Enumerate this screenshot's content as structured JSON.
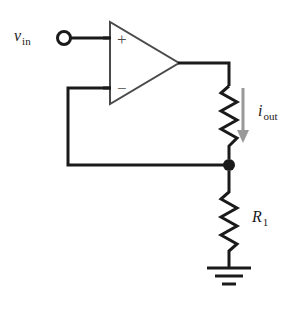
{
  "diagram": {
    "background_color": "#ffffff",
    "wire_color": "#1a1a1a",
    "component_color": "#1a1a1a",
    "arrow_color": "#999999",
    "opamp_outline_color": "#4a4a4a",
    "labels": {
      "input_voltage": {
        "base": "v",
        "subscript": "in"
      },
      "output_current": {
        "base": "i",
        "subscript": "out"
      },
      "resistor_feedback": {
        "base": "R",
        "subscript": "1"
      },
      "opamp_plus": "+",
      "opamp_minus": "−"
    },
    "components": [
      {
        "name": "input-terminal",
        "type": "terminal-node"
      },
      {
        "name": "opamp",
        "type": "operational-amplifier"
      },
      {
        "name": "output-resistor",
        "type": "resistor"
      },
      {
        "name": "feedback-resistor",
        "type": "resistor"
      },
      {
        "name": "ground",
        "type": "ground-symbol"
      },
      {
        "name": "junction-node",
        "type": "junction-dot"
      },
      {
        "name": "current-arrow",
        "type": "direction-arrow"
      }
    ]
  }
}
